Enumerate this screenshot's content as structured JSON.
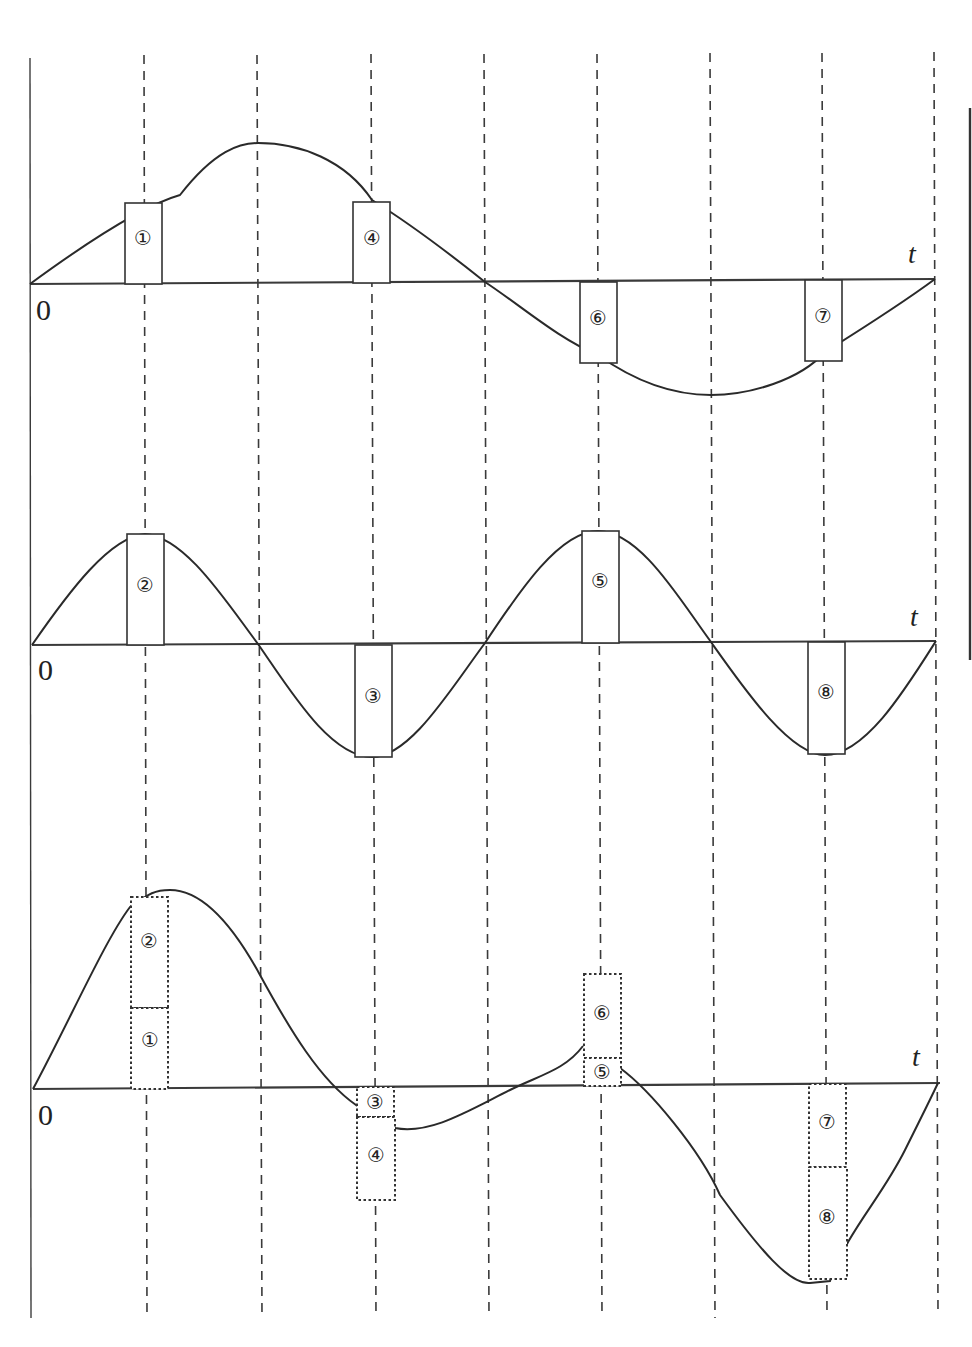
{
  "diagram": {
    "type": "waveform superposition",
    "axis_label": "t",
    "origin_label": "0",
    "panels": [
      {
        "name": "top-wave",
        "description": "fundamental sine, one period",
        "boxes": [
          {
            "id": "1",
            "label": "①"
          },
          {
            "id": "4",
            "label": "④"
          },
          {
            "id": "6",
            "label": "⑥"
          },
          {
            "id": "7",
            "label": "⑦"
          }
        ]
      },
      {
        "name": "middle-wave",
        "description": "second harmonic sine, two periods",
        "boxes": [
          {
            "id": "2",
            "label": "②"
          },
          {
            "id": "3",
            "label": "③"
          },
          {
            "id": "5",
            "label": "⑤"
          },
          {
            "id": "8",
            "label": "⑧"
          }
        ]
      },
      {
        "name": "bottom-wave",
        "description": "sum of top and middle waves",
        "boxes": [
          {
            "id": "2",
            "label": "②"
          },
          {
            "id": "1",
            "label": "①"
          },
          {
            "id": "3",
            "label": "③"
          },
          {
            "id": "4",
            "label": "④"
          },
          {
            "id": "6",
            "label": "⑥"
          },
          {
            "id": "5",
            "label": "⑤"
          },
          {
            "id": "7",
            "label": "⑦"
          },
          {
            "id": "8",
            "label": "⑧"
          }
        ]
      }
    ]
  }
}
